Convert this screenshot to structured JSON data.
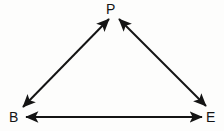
{
  "diagram": {
    "background_color": "#fdfdfc",
    "stroke_color": "#141414",
    "stroke_width": 2,
    "label_color": "#141414",
    "vertices": [
      {
        "id": "P",
        "label": "P",
        "x": 113,
        "y": 9,
        "role": "apex-top"
      },
      {
        "id": "B",
        "label": "B",
        "x": 14,
        "y": 117,
        "role": "bottom-left"
      },
      {
        "id": "E",
        "label": "E",
        "x": 211,
        "y": 117,
        "role": "bottom-right"
      }
    ],
    "edges": [
      {
        "id": "B-P",
        "from": "B",
        "to": "P",
        "arrowheads": "both",
        "x1": 23,
        "y1": 107,
        "x2": 109,
        "y2": 19
      },
      {
        "id": "P-E",
        "from": "P",
        "to": "E",
        "arrowheads": "both",
        "x1": 119,
        "y1": 19,
        "x2": 206,
        "y2": 106
      },
      {
        "id": "B-E",
        "from": "B",
        "to": "E",
        "arrowheads": "both",
        "x1": 26,
        "y1": 117,
        "x2": 202,
        "y2": 117
      }
    ]
  }
}
